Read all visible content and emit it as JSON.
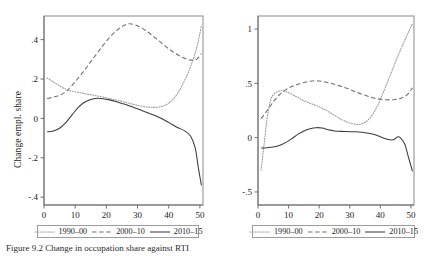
{
  "figure": {
    "caption_prefix": "Figure",
    "caption_number": "9.2",
    "caption_text": "Change in occupation share against RTI",
    "caption_full": "Figure   9.2  Change in occupation share against RTI"
  },
  "legend": {
    "items": [
      {
        "label": "1990–00",
        "style": "dotted",
        "color": "#9a9a9a"
      },
      {
        "label": "2000–10",
        "style": "dashed",
        "color": "#707070"
      },
      {
        "label": "2010–15",
        "style": "solid",
        "color": "#3a3a3a"
      }
    ]
  },
  "chart_data": [
    {
      "type": "line",
      "panel": "left",
      "title": "",
      "xlabel": "",
      "ylabel": "Change empl. share",
      "xlim": [
        0,
        51
      ],
      "ylim": [
        -0.44,
        0.52
      ],
      "xticks": [
        0,
        10,
        20,
        30,
        40,
        50
      ],
      "xtick_labels": [
        "0",
        "10",
        "20",
        "30",
        "40",
        "50"
      ],
      "yticks": [
        0.4,
        0.2,
        0,
        -0.2,
        -0.4
      ],
      "ytick_labels": [
        ".4",
        ".2",
        "0",
        "-.2",
        "-.4"
      ],
      "grid": false,
      "legend_position": "bottom",
      "series": [
        {
          "name": "1990–00",
          "style": "dotted",
          "color": "#9a9a9a",
          "x": [
            1,
            3,
            5,
            7,
            9,
            11,
            13,
            15,
            17,
            19,
            21,
            23,
            25,
            27,
            29,
            31,
            33,
            35,
            37,
            39,
            41,
            43,
            45,
            47,
            49,
            50.5
          ],
          "y": [
            0.205,
            0.185,
            0.165,
            0.148,
            0.138,
            0.132,
            0.126,
            0.12,
            0.114,
            0.108,
            0.101,
            0.094,
            0.086,
            0.078,
            0.07,
            0.063,
            0.058,
            0.056,
            0.058,
            0.068,
            0.09,
            0.13,
            0.19,
            0.262,
            0.36,
            0.47
          ]
        },
        {
          "name": "2000–10",
          "style": "dashed",
          "color": "#707070",
          "x": [
            1,
            3,
            5,
            7,
            9,
            11,
            13,
            15,
            17,
            19,
            21,
            23,
            25,
            27,
            29,
            31,
            33,
            35,
            37,
            39,
            41,
            43,
            45,
            47,
            49,
            50.5
          ],
          "y": [
            0.1,
            0.108,
            0.118,
            0.135,
            0.168,
            0.205,
            0.245,
            0.288,
            0.33,
            0.372,
            0.41,
            0.442,
            0.466,
            0.48,
            0.476,
            0.462,
            0.442,
            0.418,
            0.392,
            0.366,
            0.342,
            0.322,
            0.306,
            0.296,
            0.3,
            0.33
          ]
        },
        {
          "name": "2010–15",
          "style": "solid",
          "color": "#3a3a3a",
          "x": [
            1,
            3,
            5,
            7,
            9,
            11,
            13,
            15,
            17,
            19,
            21,
            23,
            25,
            27,
            29,
            31,
            33,
            35,
            37,
            39,
            41,
            43,
            45,
            47,
            48.5,
            49.5,
            50.5
          ],
          "y": [
            -0.068,
            -0.064,
            -0.05,
            -0.022,
            0.018,
            0.056,
            0.082,
            0.096,
            0.102,
            0.1,
            0.094,
            0.086,
            0.076,
            0.066,
            0.054,
            0.042,
            0.03,
            0.018,
            0.004,
            -0.012,
            -0.03,
            -0.048,
            -0.062,
            -0.09,
            -0.15,
            -0.25,
            -0.34
          ]
        }
      ]
    },
    {
      "type": "line",
      "panel": "right",
      "title": "",
      "xlabel": "",
      "ylabel": "Log change empl. share",
      "xlim": [
        0,
        51
      ],
      "ylim": [
        -0.62,
        1.12
      ],
      "xticks": [
        0,
        10,
        20,
        30,
        40,
        50
      ],
      "xtick_labels": [
        "0",
        "10",
        "20",
        "30",
        "40",
        "50"
      ],
      "yticks": [
        1,
        0.5,
        0,
        -0.5
      ],
      "ytick_labels": [
        "1",
        ".5",
        "0",
        "-.5"
      ],
      "grid": false,
      "legend_position": "bottom",
      "series": [
        {
          "name": "1990–00",
          "style": "dotted",
          "color": "#9a9a9a",
          "x": [
            1,
            2,
            3,
            4,
            5,
            7,
            9,
            11,
            13,
            15,
            17,
            19,
            21,
            23,
            25,
            27,
            29,
            31,
            33,
            35,
            37,
            39,
            41,
            43,
            45,
            47,
            49,
            50.5
          ],
          "y": [
            -0.3,
            -0.06,
            0.18,
            0.33,
            0.395,
            0.43,
            0.425,
            0.4,
            0.37,
            0.34,
            0.316,
            0.296,
            0.27,
            0.24,
            0.205,
            0.172,
            0.145,
            0.128,
            0.122,
            0.14,
            0.195,
            0.29,
            0.42,
            0.56,
            0.7,
            0.835,
            0.96,
            1.05
          ]
        },
        {
          "name": "2000–10",
          "style": "dashed",
          "color": "#707070",
          "x": [
            1,
            3,
            5,
            7,
            9,
            11,
            13,
            15,
            17,
            19,
            21,
            23,
            25,
            27,
            29,
            31,
            33,
            35,
            37,
            39,
            41,
            43,
            45,
            47,
            49,
            50.5
          ],
          "y": [
            0.175,
            0.25,
            0.33,
            0.395,
            0.44,
            0.47,
            0.492,
            0.508,
            0.52,
            0.524,
            0.518,
            0.506,
            0.492,
            0.474,
            0.454,
            0.432,
            0.41,
            0.39,
            0.372,
            0.358,
            0.35,
            0.348,
            0.352,
            0.366,
            0.4,
            0.46
          ]
        },
        {
          "name": "2010–15",
          "style": "solid",
          "color": "#3a3a3a",
          "x": [
            1,
            3,
            5,
            7,
            9,
            11,
            13,
            15,
            17,
            19,
            21,
            23,
            25,
            27,
            29,
            31,
            33,
            35,
            37,
            39,
            41,
            43,
            44.5,
            45.5,
            46.5,
            48,
            49,
            50.5
          ],
          "y": [
            -0.095,
            -0.092,
            -0.086,
            -0.072,
            -0.046,
            -0.01,
            0.03,
            0.062,
            0.082,
            0.092,
            0.088,
            0.072,
            0.062,
            0.058,
            0.056,
            0.054,
            0.052,
            0.046,
            0.036,
            0.02,
            -0.004,
            -0.02,
            -0.018,
            0.006,
            0.0,
            -0.06,
            -0.16,
            -0.31
          ]
        }
      ]
    }
  ]
}
